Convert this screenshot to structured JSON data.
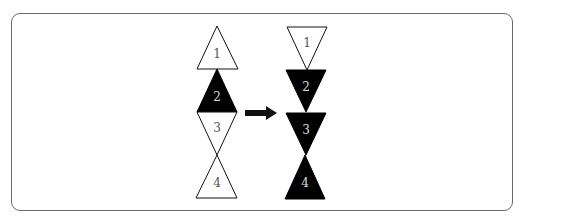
{
  "diagram": {
    "colors": {
      "stroke": "#111111",
      "filled": "#000000",
      "empty": "#ffffff",
      "label_on_white": "#555555",
      "label_on_black": "#dddddd",
      "frame": "#6a6a6a"
    },
    "before": {
      "triangles": [
        {
          "label": "1",
          "orientation": "up",
          "fill": "white"
        },
        {
          "label": "2",
          "orientation": "up",
          "fill": "black"
        },
        {
          "label": "3",
          "orientation": "down",
          "fill": "white"
        },
        {
          "label": "4",
          "orientation": "up",
          "fill": "white"
        }
      ]
    },
    "arrow": {
      "direction": "right"
    },
    "after": {
      "triangles": [
        {
          "label": "1",
          "orientation": "down",
          "fill": "white"
        },
        {
          "label": "2",
          "orientation": "down",
          "fill": "black"
        },
        {
          "label": "3",
          "orientation": "down",
          "fill": "black"
        },
        {
          "label": "4",
          "orientation": "up",
          "fill": "black"
        }
      ]
    }
  }
}
